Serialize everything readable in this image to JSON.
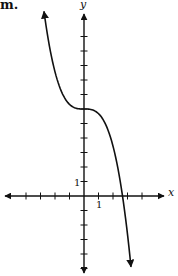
{
  "problem": {
    "part_label": "m."
  },
  "axes": {
    "x_label": "x",
    "y_label": "y",
    "x_tick_label": "1",
    "y_tick_label": "1"
  },
  "chart_data": {
    "type": "line",
    "title": "m.",
    "xlabel": "x",
    "ylabel": "y",
    "xlim": [
      -5.5,
      5.5
    ],
    "ylim": [
      -5.5,
      12.5
    ],
    "grid": false,
    "x_ticks": [
      -4,
      -3,
      -2,
      -1,
      1,
      2,
      3,
      4
    ],
    "y_ticks": [
      -5,
      -4,
      -3,
      -2,
      -1,
      1,
      2,
      3,
      4,
      5,
      6,
      7,
      8,
      9,
      10,
      11
    ],
    "labeled_ticks": {
      "x": 1,
      "y": 1
    },
    "series": [
      {
        "name": "f(x) = -0.32x^3 + 6",
        "description": "Decreasing cubic with inflection point on y-axis at (0, 6), arrows at both ends",
        "x": [
          -2.76,
          -2,
          -1,
          0,
          1,
          2,
          2.66,
          3.24
        ],
        "y": [
          12.3,
          8.56,
          6.32,
          6,
          5.68,
          3.44,
          0,
          -5.24
        ]
      }
    ],
    "annotations": [
      "inflection point at (0, 6)",
      "x-intercept ≈ 2.66"
    ]
  }
}
